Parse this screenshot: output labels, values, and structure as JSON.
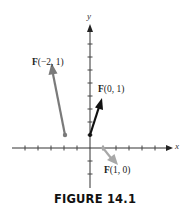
{
  "figure": {
    "caption": "FIGURE 14.1",
    "x_axis_label": "x",
    "y_axis_label": "y",
    "vectors": [
      {
        "label_bold": "F",
        "label_args": "(−2, 1)",
        "base": [
          -2,
          1
        ],
        "color": "#7a7a7a"
      },
      {
        "label_bold": "F",
        "label_args": "(0, 1)",
        "base": [
          0,
          1
        ],
        "color": "#111111"
      },
      {
        "label_bold": "F",
        "label_args": "(1, 0)",
        "base": [
          1,
          0
        ],
        "color": "#a8a8a8"
      }
    ]
  }
}
